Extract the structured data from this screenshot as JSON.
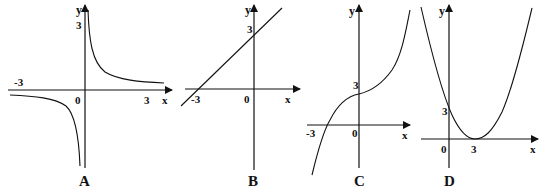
{
  "figure": {
    "graphs": [
      {
        "id": "A",
        "caption": "A",
        "type": "hyperbola",
        "axis_labels": {
          "x": "x",
          "y": "y"
        },
        "ticks": {
          "x_neg": "-3",
          "origin": "0",
          "x_pos": "3",
          "y_pos": "3"
        }
      },
      {
        "id": "B",
        "caption": "B",
        "type": "line",
        "axis_labels": {
          "x": "x",
          "y": "y"
        },
        "ticks": {
          "x_neg": "-3",
          "origin": "0",
          "y_pos": "3"
        }
      },
      {
        "id": "C",
        "caption": "C",
        "type": "cubic",
        "axis_labels": {
          "x": "x",
          "y": "y"
        },
        "ticks": {
          "x_neg": "-3",
          "origin": "0",
          "y_pos": "3"
        }
      },
      {
        "id": "D",
        "caption": "D",
        "type": "parabola",
        "axis_labels": {
          "x": "x",
          "y": "y"
        },
        "ticks": {
          "origin": "0",
          "x_pos": "3",
          "y_pos": "3"
        }
      }
    ]
  }
}
